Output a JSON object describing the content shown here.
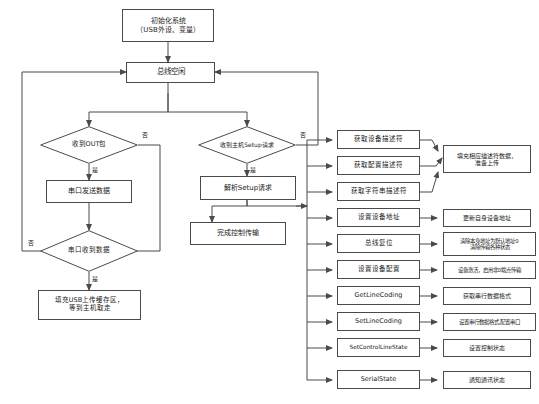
{
  "diagram": {
    "stroke_color": "#4a4a4a",
    "text_color": "#1b1b1b",
    "background_color": "#ffffff",
    "nodes": {
      "init": {
        "line1": "初始化系统",
        "line2": "（USB外设、变量）"
      },
      "bus_idle": {
        "line1": "总线空闲"
      },
      "recv_out": {
        "line1": "收到OUT包"
      },
      "uart_send": {
        "line1": "串口发送数据"
      },
      "uart_recv": {
        "line1": "串口收到数据"
      },
      "fill_usb": {
        "line1": "填充USB上传缓存区，",
        "line2": "等到主机取走"
      },
      "recv_setup": {
        "line1": "收到主机Setup请求"
      },
      "parse_setup": {
        "line1": "解析Setup请求"
      },
      "finish_ctrl": {
        "line1": "完成控制传输"
      },
      "req_dev_desc": {
        "line1": "获取设备描述符"
      },
      "req_cfg_desc": {
        "line1": "获取配置描述符"
      },
      "req_str_desc": {
        "line1": "获取字符串描述符"
      },
      "set_address": {
        "line1": "设置设备地址"
      },
      "bus_reset": {
        "line1": "总线复位"
      },
      "set_config": {
        "line1": "设置设备配置"
      },
      "get_line_coding": {
        "line1": "GetLineCoding"
      },
      "set_line_coding": {
        "line1": "SetLineCoding"
      },
      "set_control_line_state": {
        "line1": "SetControlLineState"
      },
      "serial_state": {
        "line1": "SerialState"
      },
      "act_fill_desc": {
        "line1": "填充相应描述符数据，",
        "line2": "准备上传"
      },
      "act_update_addr": {
        "line1": "更新自身设备地址"
      },
      "act_bus_reset": {
        "line1": "清除本身地址为默认地址0",
        "line2": "清除传输各种状态"
      },
      "act_activate": {
        "line1": "设备激活，启用非0端点传输"
      },
      "act_get_fmt": {
        "line1": "获取串行数据格式"
      },
      "act_set_fmt": {
        "line1": "设置串行数据格式,配置串口"
      },
      "act_set_ctrl_state": {
        "line1": "设置控制状态"
      },
      "act_notify_state": {
        "line1": "通知通讯状态"
      }
    },
    "edge_labels": {
      "out_yes": "是",
      "out_no": "否",
      "uart_yes": "是",
      "uart_no": "否",
      "setup_yes": "是",
      "setup_no": "否"
    }
  }
}
